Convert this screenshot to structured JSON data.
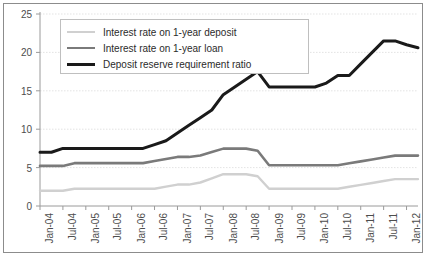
{
  "chart_data": {
    "type": "line",
    "title": "",
    "xlabel": "",
    "ylabel": "",
    "ylim": [
      0,
      25
    ],
    "yticks": [
      0,
      5,
      10,
      15,
      20,
      25
    ],
    "grid": true,
    "legend_position": "top-left",
    "categories": [
      "Jan-04",
      "Apr-04",
      "Jul-04",
      "Oct-04",
      "Jan-05",
      "Apr-05",
      "Jul-05",
      "Oct-05",
      "Jan-06",
      "Apr-06",
      "Jul-06",
      "Oct-06",
      "Jan-07",
      "Apr-07",
      "Jul-07",
      "Oct-07",
      "Jan-08",
      "Apr-08",
      "Jul-08",
      "Oct-08",
      "Jan-09",
      "Apr-09",
      "Jul-09",
      "Oct-09",
      "Jan-10",
      "Apr-10",
      "Jul-10",
      "Oct-10",
      "Jan-11",
      "Apr-11",
      "Jul-11",
      "Oct-11",
      "Jan-12",
      "Apr-12"
    ],
    "xtick_labels": [
      "Jan-04",
      "Jul-04",
      "Jan-05",
      "Jul-05",
      "Jan-06",
      "Jul-06",
      "Jan-07",
      "Jul-07",
      "Jan-08",
      "Jul-08",
      "Jan-09",
      "Jul-09",
      "Jan-10",
      "Jul-10",
      "Jan-11",
      "Jul-11",
      "Jan-12"
    ],
    "series": [
      {
        "name": "Interest rate on 1-year deposit",
        "color": "#d0d0d0",
        "width": 2.4,
        "values": [
          1.98,
          1.98,
          1.98,
          2.25,
          2.25,
          2.25,
          2.25,
          2.25,
          2.25,
          2.25,
          2.25,
          2.52,
          2.79,
          2.79,
          3.06,
          3.6,
          4.14,
          4.14,
          4.14,
          3.87,
          2.25,
          2.25,
          2.25,
          2.25,
          2.25,
          2.25,
          2.25,
          2.5,
          2.75,
          3.0,
          3.25,
          3.5,
          3.5,
          3.5
        ]
      },
      {
        "name": "Interest rate on 1-year loan",
        "color": "#7a7a7a",
        "width": 2.6,
        "values": [
          5.22,
          5.22,
          5.22,
          5.58,
          5.58,
          5.58,
          5.58,
          5.58,
          5.58,
          5.58,
          5.85,
          6.12,
          6.39,
          6.39,
          6.57,
          7.02,
          7.47,
          7.47,
          7.47,
          7.2,
          5.31,
          5.31,
          5.31,
          5.31,
          5.31,
          5.31,
          5.31,
          5.56,
          5.81,
          6.06,
          6.31,
          6.56,
          6.56,
          6.56
        ]
      },
      {
        "name": "Deposit reserve requirement ratio",
        "color": "#1a1a1a",
        "width": 3.0,
        "values": [
          7.0,
          7.0,
          7.5,
          7.5,
          7.5,
          7.5,
          7.5,
          7.5,
          7.5,
          7.5,
          8.0,
          8.5,
          9.5,
          10.5,
          11.5,
          12.5,
          14.5,
          15.5,
          16.5,
          17.5,
          15.5,
          15.5,
          15.5,
          15.5,
          15.5,
          16.0,
          17.0,
          17.0,
          18.5,
          20.0,
          21.5,
          21.5,
          21.0,
          20.6
        ]
      }
    ]
  }
}
